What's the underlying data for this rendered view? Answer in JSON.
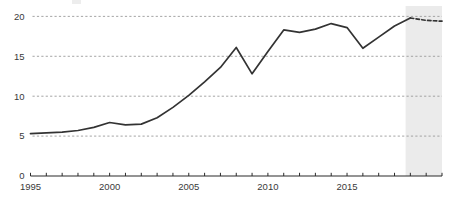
{
  "chart_data": {
    "type": "line",
    "title": "",
    "subtitle": "",
    "xlabel": "",
    "ylabel": "",
    "xlim": [
      1995,
      2021
    ],
    "ylim": [
      0,
      20.8
    ],
    "yticks": [
      0,
      5,
      10,
      15,
      20
    ],
    "ytick_labels": [
      "0",
      "5",
      "10",
      "15",
      "20"
    ],
    "xticks": [
      1995,
      1996,
      1997,
      1998,
      1999,
      2000,
      2001,
      2002,
      2003,
      2004,
      2005,
      2006,
      2007,
      2008,
      2009,
      2010,
      2011,
      2012,
      2013,
      2014,
      2015,
      2016,
      2017,
      2018,
      2019,
      2020,
      2021
    ],
    "xtick_labels_shown": [
      "1995",
      "2000",
      "2005",
      "2010",
      "2015"
    ],
    "xtick_labels_shown_values": [
      1995,
      2000,
      2005,
      2010,
      2015
    ],
    "grid": "horizontal-dashed",
    "legend": "none",
    "series": [
      {
        "name": "value",
        "x": [
          1995,
          1996,
          1997,
          1998,
          1999,
          2000,
          2001,
          2002,
          2003,
          2004,
          2005,
          2006,
          2007,
          2008,
          2009,
          2010,
          2011,
          2012,
          2013,
          2014,
          2015,
          2016,
          2017,
          2018,
          2019
        ],
        "values": [
          5.3,
          5.4,
          5.5,
          5.7,
          6.1,
          6.7,
          6.4,
          6.5,
          7.3,
          8.6,
          10.1,
          11.8,
          13.6,
          16.1,
          12.8,
          15.6,
          18.3,
          18.0,
          18.4,
          19.1,
          18.6,
          16.0,
          17.4,
          18.8,
          19.8
        ],
        "style": "solid"
      },
      {
        "name": "value-forecast",
        "x": [
          2019,
          2020,
          2021
        ],
        "values": [
          19.8,
          19.5,
          19.4
        ],
        "style": "dashed"
      }
    ],
    "shaded_regions": [
      {
        "name": "forecast-band",
        "x_start": 2018.7,
        "x_end": 2021.0,
        "color": "#e8e8e8"
      }
    ],
    "colors": {
      "line": "#333333",
      "grid": "#9a9a9a",
      "axis": "#2b2b2b",
      "text": "#3a3a3a",
      "background": "#ffffff",
      "shade": "#e8e8e8"
    }
  }
}
